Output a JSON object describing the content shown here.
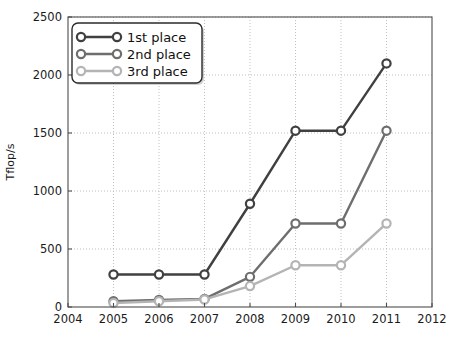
{
  "chart_data": {
    "type": "line",
    "title": "",
    "xlabel": "",
    "ylabel": "Tflop/s",
    "x": [
      2005,
      2006,
      2007,
      2008,
      2009,
      2010,
      2011
    ],
    "xlim": [
      2004,
      2012
    ],
    "ylim": [
      0,
      2500
    ],
    "xticks": [
      2004,
      2005,
      2006,
      2007,
      2008,
      2009,
      2010,
      2011,
      2012
    ],
    "xtick_labels": [
      "2004",
      "2005",
      "2006",
      "2007",
      "2008",
      "2009",
      "2010",
      "2011",
      "2012"
    ],
    "yticks": [
      0,
      500,
      1000,
      1500,
      2000,
      2500
    ],
    "ytick_labels": [
      "0",
      "500",
      "1000",
      "1500",
      "2000",
      "2500"
    ],
    "grid": true,
    "grid_style": "dotted",
    "legend_position": "upper left",
    "series": [
      {
        "name": "1st place",
        "color": "#404040",
        "marker": "circle",
        "values": [
          280,
          280,
          280,
          890,
          1520,
          1520,
          2100
        ]
      },
      {
        "name": "2nd place",
        "color": "#6e6e6e",
        "marker": "circle",
        "values": [
          50,
          60,
          70,
          260,
          720,
          720,
          1520
        ]
      },
      {
        "name": "3rd place",
        "color": "#b4b4b4",
        "marker": "circle",
        "values": [
          35,
          50,
          65,
          180,
          360,
          360,
          720
        ]
      }
    ]
  },
  "axes": {
    "ylabel": "Tflop/s",
    "ytick_labels": [
      "0",
      "500",
      "1000",
      "1500",
      "2000",
      "2500"
    ],
    "xtick_labels": [
      "2004",
      "2005",
      "2006",
      "2007",
      "2008",
      "2009",
      "2010",
      "2011",
      "2012"
    ]
  },
  "legend": {
    "entries": [
      {
        "label": "1st place",
        "color": "#404040"
      },
      {
        "label": "2nd place",
        "color": "#6e6e6e"
      },
      {
        "label": "3rd place",
        "color": "#b4b4b4"
      }
    ]
  }
}
